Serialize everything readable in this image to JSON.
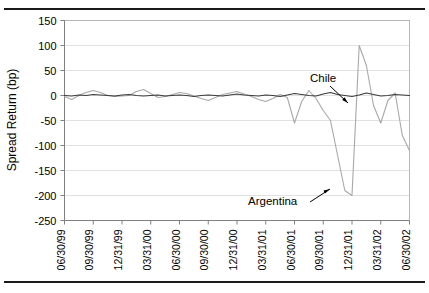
{
  "figure": {
    "rules": {
      "top": "horizontal-rule",
      "bottom": "horizontal-rule"
    }
  },
  "chart_data": {
    "type": "line",
    "title": "",
    "xlabel": "",
    "ylabel": "Spread Return (bp)",
    "ylim": [
      -250,
      150
    ],
    "yticks": [
      150,
      100,
      50,
      0,
      -50,
      -100,
      -150,
      -200,
      -250
    ],
    "grid": true,
    "legend_position": "annotations-inline",
    "categories": [
      "06/30/99",
      "09/30/99",
      "12/31/99",
      "03/31/00",
      "06/30/00",
      "09/30/00",
      "12/31/00",
      "03/31/01",
      "06/30/01",
      "09/30/01",
      "12/31/01",
      "03/31/02",
      "06/30/02"
    ],
    "annotations": [
      {
        "text": "Chile",
        "series": "Chile"
      },
      {
        "text": "Argentina",
        "series": "Argentina"
      }
    ],
    "series": [
      {
        "name": "Chile",
        "color": "#3c3c3c",
        "x": [
          0,
          0.25,
          0.5,
          0.75,
          1,
          1.25,
          1.5,
          1.75,
          2,
          2.25,
          2.5,
          2.75,
          3,
          3.25,
          3.5,
          3.75,
          4,
          4.25,
          4.5,
          4.75,
          5,
          5.25,
          5.5,
          5.75,
          6,
          6.25,
          6.5,
          6.75,
          7,
          7.25,
          7.5,
          7.75,
          8,
          8.25,
          8.5,
          8.75,
          9,
          9.25,
          9.5,
          9.75,
          10,
          10.25,
          10.5,
          10.75,
          11,
          11.25,
          11.5,
          11.75,
          12
        ],
        "values": [
          0,
          -1,
          1,
          0,
          2,
          1,
          0,
          -1,
          1,
          2,
          0,
          -1,
          0,
          1,
          -1,
          0,
          1,
          0,
          -2,
          0,
          1,
          0,
          -1,
          1,
          3,
          1,
          0,
          -1,
          1,
          0,
          -2,
          1,
          4,
          2,
          0,
          -1,
          3,
          6,
          2,
          0,
          -2,
          1,
          5,
          2,
          -1,
          0,
          2,
          1,
          0
        ]
      },
      {
        "name": "Argentina",
        "color": "#a8a8a8",
        "x": [
          0,
          0.25,
          0.5,
          0.75,
          1,
          1.25,
          1.5,
          1.75,
          2,
          2.25,
          2.5,
          2.75,
          3,
          3.25,
          3.5,
          3.75,
          4,
          4.25,
          4.5,
          4.75,
          5,
          5.25,
          5.5,
          5.75,
          6,
          6.25,
          6.5,
          6.75,
          7,
          7.25,
          7.5,
          7.75,
          8,
          8.25,
          8.5,
          8.75,
          9,
          9.25,
          9.5,
          9.75,
          10,
          10.25,
          10.5,
          10.75,
          11,
          11.25,
          11.5,
          11.75,
          12
        ],
        "values": [
          -2,
          -8,
          0,
          6,
          10,
          6,
          0,
          -2,
          -1,
          0,
          8,
          12,
          4,
          -4,
          -2,
          2,
          6,
          4,
          -1,
          -6,
          -10,
          -4,
          2,
          5,
          8,
          3,
          -2,
          -8,
          -12,
          -6,
          2,
          -4,
          -55,
          -12,
          10,
          -6,
          -30,
          -50,
          -120,
          -190,
          -200,
          100,
          60,
          -20,
          -55,
          -10,
          5,
          -80,
          -110
        ]
      }
    ]
  }
}
